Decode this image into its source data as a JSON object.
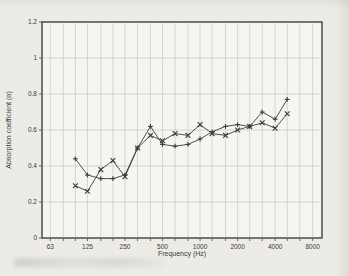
{
  "figure": {
    "background_color": "#ecebe6",
    "plot_background": "#f6f5f1",
    "grid_color": "#c9c7c0",
    "frame_color": "#4a4a4a",
    "line_color": "#3c3c3c"
  },
  "chart_data": {
    "type": "line",
    "title": "",
    "xlabel": "Frequency (Hz)",
    "ylabel": "Absorption coefficient (α)",
    "x_scale": "log",
    "xlim": [
      54,
      9500
    ],
    "ylim": [
      0,
      1.2
    ],
    "grid": true,
    "legend": "none",
    "x_tick_values": [
      63,
      125,
      250,
      500,
      1000,
      2000,
      4000,
      8000
    ],
    "x_tick_labels": [
      "63",
      "125",
      "250",
      "500",
      "1000",
      "2000",
      "4000",
      "8000"
    ],
    "y_tick_values": [
      0,
      0.2,
      0.4,
      0.6,
      0.8,
      1,
      1.2
    ],
    "y_tick_labels": [
      "0",
      "0.2",
      "0.4",
      "0.6",
      "0.8",
      "1",
      "1.2"
    ],
    "x_grid_values": [
      63,
      80,
      100,
      125,
      160,
      200,
      250,
      315,
      400,
      500,
      630,
      800,
      1000,
      1250,
      1600,
      2000,
      2500,
      3150,
      4000,
      5000,
      6300,
      8000
    ],
    "x": [
      100,
      125,
      160,
      200,
      250,
      315,
      400,
      500,
      630,
      800,
      1000,
      1250,
      1600,
      2000,
      2500,
      3150,
      4000,
      5000
    ],
    "series": [
      {
        "name": "series-plus",
        "marker": "plus",
        "color": "#3c3c3c",
        "values": [
          0.44,
          0.35,
          0.33,
          0.33,
          0.35,
          0.5,
          0.62,
          0.52,
          0.51,
          0.52,
          0.55,
          0.59,
          0.62,
          0.63,
          0.62,
          0.7,
          0.66,
          0.77
        ]
      },
      {
        "name": "series-cross",
        "marker": "x",
        "color": "#3c3c3c",
        "values": [
          0.29,
          0.26,
          0.38,
          0.43,
          0.34,
          0.5,
          0.57,
          0.54,
          0.58,
          0.57,
          0.63,
          0.58,
          0.57,
          0.6,
          0.62,
          0.64,
          0.61,
          0.69
        ]
      }
    ]
  }
}
